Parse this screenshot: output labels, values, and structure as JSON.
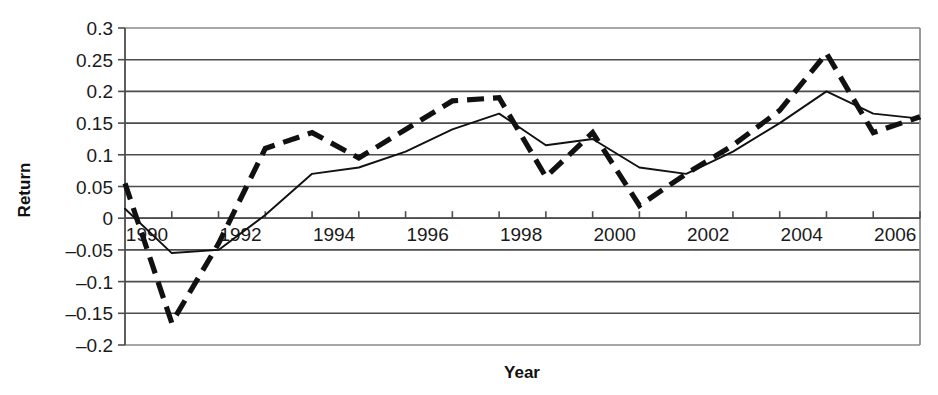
{
  "chart_data": {
    "type": "line",
    "title": "",
    "xlabel": "Year",
    "ylabel": "Return",
    "xlim": [
      1990,
      2007
    ],
    "ylim": [
      -0.2,
      0.3
    ],
    "grid": true,
    "legend_position": "none",
    "x": [
      1990,
      1991,
      1992,
      1993,
      1994,
      1995,
      1996,
      1997,
      1998,
      1999,
      2000,
      2001,
      2002,
      2003,
      2004,
      2005,
      2006,
      2007
    ],
    "x_tick_labels": [
      "1990",
      "1992",
      "1994",
      "1996",
      "1998",
      "2000",
      "2002",
      "2004",
      "2006"
    ],
    "x_tick_values": [
      1990,
      1992,
      1994,
      1996,
      1998,
      2000,
      2002,
      2004,
      2006
    ],
    "y_tick_labels": [
      "0.3",
      "0.25",
      "0.2",
      "0.15",
      "0.1",
      "0.05",
      "0",
      "–0.05",
      "–0.1",
      "–0.15",
      "–0.2"
    ],
    "y_tick_values": [
      0.3,
      0.25,
      0.2,
      0.15,
      0.1,
      0.05,
      0,
      -0.05,
      -0.1,
      -0.15,
      -0.2
    ],
    "series": [
      {
        "name": "dashed-series",
        "style": "dashed",
        "color": "#111111",
        "values": [
          0.055,
          -0.165,
          -0.04,
          0.11,
          0.135,
          0.095,
          0.14,
          0.185,
          0.19,
          0.065,
          0.135,
          0.02,
          0.07,
          0.115,
          0.17,
          0.26,
          0.135,
          0.16
        ]
      },
      {
        "name": "solid-series",
        "style": "solid",
        "color": "#111111",
        "values": [
          0.015,
          -0.055,
          -0.05,
          0.005,
          0.07,
          0.08,
          0.105,
          0.14,
          0.165,
          0.115,
          0.125,
          0.08,
          0.07,
          0.105,
          0.15,
          0.2,
          0.165,
          0.157
        ]
      }
    ]
  },
  "axes": {
    "y_title": "Return",
    "x_title": "Year"
  }
}
